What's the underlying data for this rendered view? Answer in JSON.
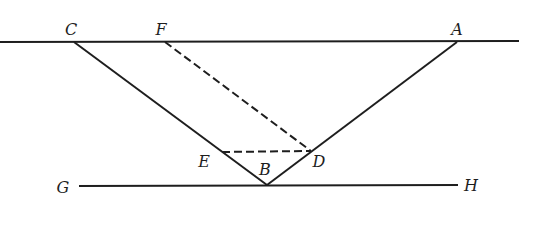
{
  "diagram": {
    "stroke_color": "#1e1e1e",
    "background": "#ffffff",
    "points": {
      "C": {
        "label": "C",
        "x": 74,
        "y": 42,
        "label_x": 71,
        "label_y": 30
      },
      "F": {
        "label": "F",
        "x": 165,
        "y": 42,
        "label_x": 161,
        "label_y": 30
      },
      "A": {
        "label": "A",
        "x": 457,
        "y": 42,
        "label_x": 457,
        "label_y": 30
      },
      "E": {
        "label": "E",
        "x": 222,
        "y": 152,
        "label_x": 204,
        "label_y": 162
      },
      "B": {
        "label": "B",
        "x": 267,
        "y": 185,
        "label_x": 265,
        "label_y": 170
      },
      "D": {
        "label": "D",
        "x": 311,
        "y": 151,
        "label_x": 319,
        "label_y": 162
      },
      "G": {
        "label": "G",
        "x": 79,
        "y": 186,
        "label_x": 63,
        "label_y": 188
      },
      "H": {
        "label": "H",
        "x": 458,
        "y": 186,
        "label_x": 471,
        "label_y": 186
      }
    },
    "segments": [
      {
        "name": "top-line",
        "from": [
          0,
          42
        ],
        "to": [
          519,
          41
        ],
        "style": "solid"
      },
      {
        "name": "segment-CB",
        "from": [
          74,
          42
        ],
        "to": [
          267,
          185
        ],
        "style": "solid"
      },
      {
        "name": "segment-AB",
        "from": [
          457,
          42
        ],
        "to": [
          267,
          185
        ],
        "style": "solid"
      },
      {
        "name": "segment-GH",
        "from": [
          79,
          186
        ],
        "to": [
          458,
          185
        ],
        "style": "solid"
      },
      {
        "name": "segment-FD",
        "from": [
          165,
          42
        ],
        "to": [
          311,
          151
        ],
        "style": "dashed"
      },
      {
        "name": "segment-ED",
        "from": [
          222,
          152
        ],
        "to": [
          311,
          151
        ],
        "style": "dashed"
      }
    ],
    "labels": [
      "C",
      "F",
      "A",
      "E",
      "B",
      "D",
      "G",
      "H"
    ]
  }
}
